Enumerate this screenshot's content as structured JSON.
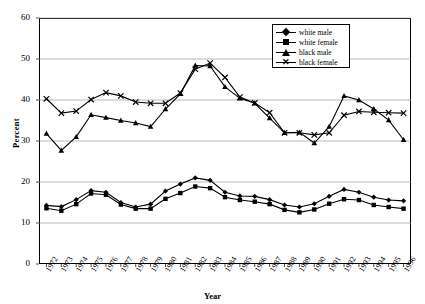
{
  "chart_data": {
    "type": "line",
    "title": "",
    "xlabel": "Year",
    "ylabel": "Percent",
    "ylim": [
      0,
      60
    ],
    "ytick_values": [
      0,
      10,
      20,
      30,
      40,
      50,
      60
    ],
    "grid": "horizontal",
    "legend_position": "top-right-inside",
    "categories": [
      "1972",
      "1973",
      "1974",
      "1975",
      "1976",
      "1977",
      "1978",
      "1979",
      "1980",
      "1981",
      "1982",
      "1983",
      "1984",
      "1985",
      "1986",
      "1987",
      "1988",
      "1989",
      "1990",
      "1991",
      "1992",
      "1993",
      "1994",
      "1995",
      "1996"
    ],
    "series": [
      {
        "name": "white male",
        "marker": "diamond",
        "values": [
          14.3,
          14.0,
          15.7,
          17.9,
          17.5,
          15.0,
          13.9,
          14.6,
          17.8,
          19.5,
          21.0,
          20.4,
          17.5,
          16.6,
          16.5,
          15.7,
          14.4,
          13.9,
          14.7,
          16.5,
          18.2,
          17.5,
          16.3,
          15.6,
          15.4
        ]
      },
      {
        "name": "white female",
        "marker": "square",
        "values": [
          13.6,
          13.0,
          14.6,
          17.2,
          16.9,
          14.5,
          13.5,
          13.5,
          15.9,
          17.3,
          18.9,
          18.5,
          16.3,
          15.6,
          15.2,
          14.6,
          13.2,
          12.6,
          13.3,
          14.7,
          15.8,
          15.6,
          14.4,
          13.9,
          13.5
        ]
      },
      {
        "name": "black male",
        "marker": "triangle",
        "values": [
          31.8,
          27.7,
          31.0,
          36.4,
          35.7,
          35.0,
          34.4,
          33.5,
          37.8,
          41.5,
          48.4,
          48.3,
          43.2,
          40.4,
          39.2,
          35.6,
          32.0,
          32.1,
          29.5,
          33.5,
          41.0,
          40.0,
          37.8,
          35.1,
          30.3
        ]
      },
      {
        "name": "black female",
        "marker": "x",
        "values": [
          40.3,
          36.8,
          37.3,
          40.1,
          41.8,
          41.0,
          39.5,
          39.2,
          39.2,
          41.7,
          47.5,
          49.0,
          45.5,
          40.7,
          39.3,
          36.9,
          32.0,
          32.0,
          31.5,
          32.0,
          36.3,
          37.2,
          37.0,
          36.9,
          36.8
        ]
      }
    ]
  },
  "legend": {
    "items": [
      {
        "label": "white male"
      },
      {
        "label": "white female"
      },
      {
        "label": "black male"
      },
      {
        "label": "black female"
      }
    ]
  },
  "axes": {
    "y_title": "Percent",
    "x_title": "Year"
  }
}
